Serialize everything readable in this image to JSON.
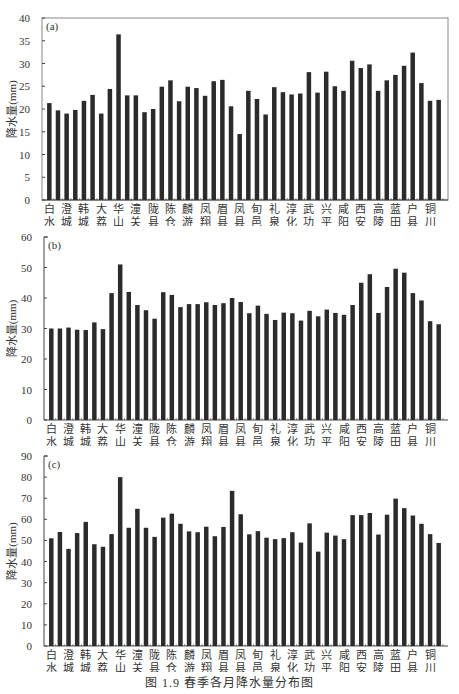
{
  "caption": "图 1.9   春季各月降水量分布图",
  "stations": [
    "白水",
    "澄城",
    "韩城",
    "大荔",
    "华山",
    "潼关",
    "陇县",
    "陈仓",
    "麟游",
    "凤翔",
    "眉县",
    "凤县",
    "旬邑",
    "礼泉",
    "淳化",
    "武功",
    "兴平",
    "咸阳",
    "西安",
    "高陵",
    "蓝田",
    "户县",
    "铜川"
  ],
  "chart_data": [
    {
      "type": "bar",
      "panel": "(a)",
      "title": "",
      "xlabel": "",
      "ylabel": "降水量(mm)",
      "ylim": [
        0,
        40
      ],
      "yticks": [
        0,
        5,
        10,
        15,
        20,
        25,
        30,
        35,
        40
      ],
      "grid": false,
      "frame": "box",
      "bar_count": 46,
      "category_labels_every_other_bar": [
        "白水",
        "澄城",
        "韩城",
        "大荔",
        "华山",
        "潼关",
        "陇县",
        "陈仓",
        "麟游",
        "凤翔",
        "眉县",
        "凤县",
        "旬邑",
        "礼泉",
        "淳化",
        "武功",
        "兴平",
        "咸阳",
        "西安",
        "高陵",
        "蓝田",
        "户县",
        "铜川"
      ],
      "values": [
        21.3,
        19.7,
        19.0,
        19.8,
        21.8,
        23.1,
        19.0,
        24.4,
        36.4,
        23.0,
        23.0,
        19.3,
        20.0,
        24.9,
        26.3,
        21.7,
        24.9,
        24.6,
        22.9,
        26.1,
        26.4,
        20.6,
        14.5,
        24.0,
        22.2,
        18.8,
        24.8,
        23.7,
        23.2,
        23.4,
        28.1,
        23.6,
        28.2,
        25.0,
        24.0,
        30.6,
        29.0,
        29.8,
        24.0,
        26.3,
        27.5,
        29.5,
        32.4,
        25.7,
        21.8,
        22.0
      ]
    },
    {
      "type": "bar",
      "panel": "(b)",
      "title": "",
      "xlabel": "",
      "ylabel": "降水量(mm)",
      "ylim": [
        0,
        60
      ],
      "yticks": [
        0,
        10,
        20,
        30,
        40,
        50,
        60
      ],
      "grid": false,
      "frame": "left-axis",
      "bar_count": 46,
      "category_labels_every_other_bar": [
        "白水",
        "澄城",
        "韩城",
        "大荔",
        "华山",
        "潼关",
        "陇县",
        "陈仓",
        "麟游",
        "凤翔",
        "眉县",
        "凤县",
        "旬邑",
        "礼泉",
        "淳化",
        "武功",
        "兴平",
        "咸阳",
        "西安",
        "高陵",
        "蓝田",
        "户县",
        "铜川"
      ],
      "values": [
        30.0,
        30.0,
        30.3,
        29.6,
        29.5,
        32.0,
        29.8,
        41.6,
        51.0,
        42.0,
        37.7,
        36.0,
        33.2,
        41.9,
        41.0,
        37.0,
        38.0,
        38.0,
        38.6,
        37.7,
        38.3,
        40.0,
        38.7,
        35.0,
        37.5,
        34.8,
        32.8,
        35.2,
        35.0,
        32.6,
        35.8,
        34.0,
        36.2,
        35.1,
        34.5,
        37.7,
        45.0,
        47.8,
        35.1,
        43.6,
        49.6,
        48.3,
        41.6,
        39.2,
        32.4,
        31.4
      ]
    },
    {
      "type": "bar",
      "panel": "(c)",
      "title": "",
      "xlabel": "",
      "ylabel": "降水量(mm)",
      "ylim": [
        0,
        90
      ],
      "yticks": [
        10,
        20,
        30,
        40,
        50,
        60,
        70,
        80,
        90
      ],
      "grid": false,
      "frame": "left-axis",
      "bar_count": 46,
      "category_labels_every_other_bar": [
        "白水",
        "澄城",
        "韩城",
        "大荔",
        "华山",
        "潼关",
        "陇县",
        "陈仓",
        "麟游",
        "凤翔",
        "眉县",
        "凤县",
        "旬邑",
        "礼泉",
        "淳化",
        "武功",
        "兴平",
        "咸阳",
        "西安",
        "高陵",
        "蓝田",
        "户县",
        "铜川"
      ],
      "values": [
        51.0,
        54.0,
        46.0,
        53.5,
        58.8,
        48.2,
        47.0,
        53.0,
        80.0,
        56.0,
        65.0,
        56.0,
        51.7,
        60.8,
        62.7,
        57.9,
        54.3,
        53.9,
        56.5,
        52.0,
        56.4,
        73.5,
        62.4,
        52.9,
        54.4,
        51.3,
        50.6,
        51.1,
        53.9,
        49.0,
        58.1,
        44.7,
        53.7,
        52.3,
        50.6,
        62.0,
        62.0,
        63.0,
        52.8,
        62.2,
        69.8,
        65.3,
        61.8,
        57.9,
        53.0,
        48.8
      ]
    }
  ],
  "colors": {
    "bar": "#2b2b2b",
    "axis": "#444444",
    "frame": "#888888",
    "text": "#333333"
  }
}
